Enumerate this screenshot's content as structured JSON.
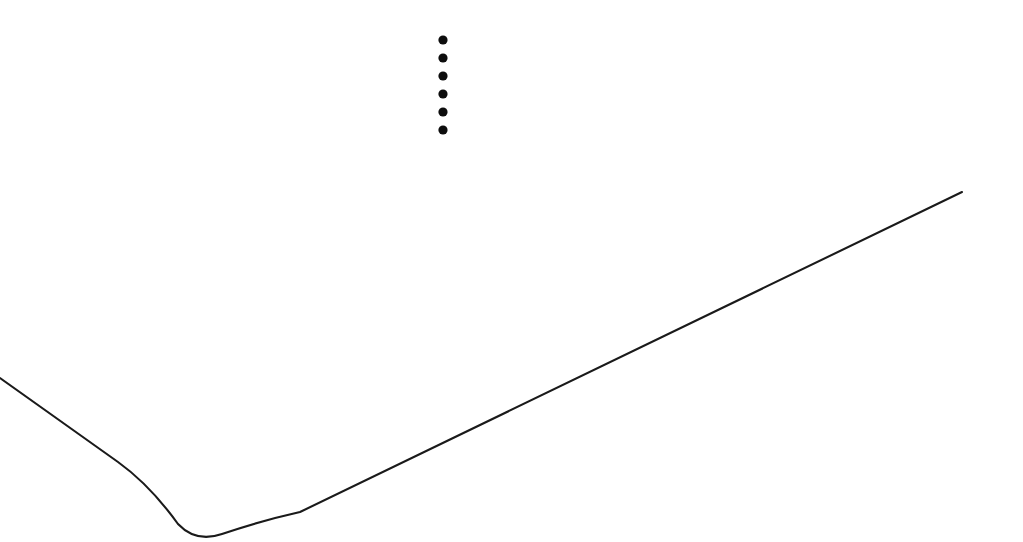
{
  "canvas": {
    "width": 1023,
    "height": 542,
    "background_color": "#ffffff",
    "description": "Scanned line drawing on blank white page"
  },
  "figure": {
    "name": "surface-edge-outline",
    "stroke_color": "#1a1a1a",
    "stroke_width": 2.1,
    "path": "M 0,378 L 118,462 Q 150,485 178,524 Q 196,543 222,534 Q 260,521 300,512 L 962,192",
    "segments": [
      {
        "name": "left-descending-edge",
        "type": "line",
        "from": [
          0,
          378
        ],
        "to": [
          120,
          464
        ]
      },
      {
        "name": "rounded-bottom-corner",
        "type": "curve",
        "from": [
          120,
          464
        ],
        "to": [
          270,
          521
        ],
        "vertex": [
          205,
          537
        ]
      },
      {
        "name": "right-ascending-edge",
        "type": "line",
        "from": [
          270,
          521
        ],
        "to": [
          962,
          192
        ]
      }
    ]
  },
  "ellipsis": {
    "name": "vertical-ellipsis",
    "dot_color": "#0d0d0d",
    "dot_radius": 4.6,
    "center_x": 443,
    "count": 6,
    "dots": [
      {
        "cx": 443,
        "cy": 40
      },
      {
        "cx": 443,
        "cy": 58
      },
      {
        "cx": 443,
        "cy": 76
      },
      {
        "cx": 443,
        "cy": 94
      },
      {
        "cx": 443,
        "cy": 112
      },
      {
        "cx": 443,
        "cy": 130
      }
    ]
  }
}
